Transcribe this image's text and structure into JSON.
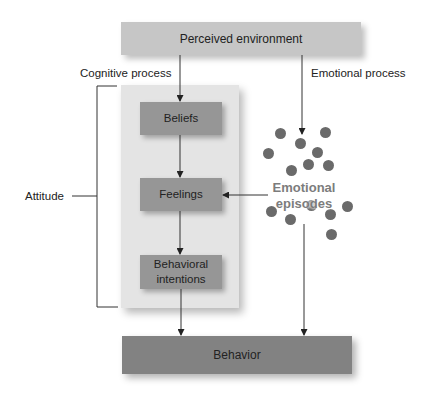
{
  "diagram": {
    "top_box": "Perceived environment",
    "cognitive_label": "Cognitive process",
    "emotional_label": "Emotional process",
    "attitude_label": "Attitude",
    "nodes": {
      "beliefs": "Beliefs",
      "feelings": "Feelings",
      "intentions_line1": "Behavioral",
      "intentions_line2": "intentions"
    },
    "emotional_episodes_line1": "Emotional",
    "emotional_episodes_line2": "episodes",
    "bottom_box": "Behavior",
    "colors": {
      "top_box": "#c6c6c6",
      "panel": "#e4e4e4",
      "node": "#969696",
      "behavior": "#828282",
      "dot": "#6a6a6a"
    }
  }
}
